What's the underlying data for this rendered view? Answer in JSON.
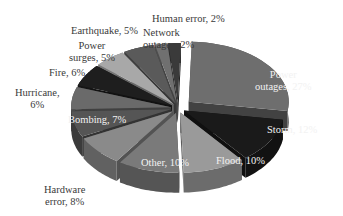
{
  "chart_data": {
    "type": "pie",
    "title": "",
    "style": "3d-exploded",
    "categories": [
      "Power outages",
      "Storm",
      "Flood",
      "Other",
      "Hardware error",
      "Bombing",
      "Hurricane",
      "Fire",
      "Power surges",
      "Earthquake",
      "Network outages",
      "Human error"
    ],
    "values": [
      27,
      12,
      10,
      10,
      8,
      7,
      6,
      6,
      5,
      5,
      2,
      2
    ],
    "unit": "%",
    "labels": {
      "power_outages": "Power outages, 27%",
      "storm": "Storm, 12%",
      "flood": "Flood, 10%",
      "other": "Other, 10%",
      "hardware_error": "Hardware error, 8%",
      "bombing": "Bombing, 7%",
      "hurricane": "Hurricane, 6%",
      "fire": "Fire, 6%",
      "power_surges": "Power surges, 5%",
      "earthquake": "Earthquake, 5%",
      "network_outages": "Network outages, 2%",
      "human_error": "Human error, 2%"
    },
    "label_lines": {
      "power_outages": [
        "Power",
        "outages, 27%"
      ],
      "storm": [
        "Storm, 12%"
      ],
      "flood": [
        "Flood, 10%"
      ],
      "other": [
        "Other, 10%"
      ],
      "hardware_error": [
        "Hardware",
        "error, 8%"
      ],
      "bombing": [
        "Bombing, 7%"
      ],
      "hurricane": [
        "Hurricane,",
        "6%"
      ],
      "fire": [
        "Fire, 6%"
      ],
      "power_surges": [
        "Power",
        "surges, 5%"
      ],
      "earthquake": [
        "Earthquake, 5%"
      ],
      "network_outages": [
        "Network",
        "outages, 2%"
      ],
      "human_error": [
        "Human error, 2%"
      ]
    },
    "colors": [
      "#6e6e6e",
      "#1a1a1a",
      "#9a9a9a",
      "#7a7a7a",
      "#8a8a8a",
      "#555555",
      "#6a6a6a",
      "#1e1e1e",
      "#a8a8a8",
      "#5a5a5a",
      "#707070",
      "#3a3a3a"
    ]
  }
}
